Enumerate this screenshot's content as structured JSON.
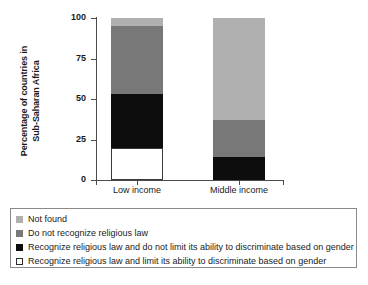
{
  "chart_data": {
    "type": "bar",
    "subtype": "stacked-bar",
    "title": "",
    "xlabel": "",
    "ylabel": "Percentage of countries in Sub-Saharan Africa",
    "ylabel_lines": [
      "Percentage of countries in",
      "Sub-Saharan Africa"
    ],
    "categories": [
      "Low income",
      "Middle income"
    ],
    "ylim": [
      0,
      100
    ],
    "yticks": [
      0,
      25,
      50,
      75,
      100
    ],
    "ytick_labels": [
      "0",
      "25",
      "50",
      "75",
      "100"
    ],
    "grid": false,
    "legend_position": "below",
    "series": [
      {
        "name": "Recognize religious law and limit its ability to discriminate based on gender",
        "color": "#ffffff",
        "border": "#3a3a3a",
        "values": [
          20,
          0
        ]
      },
      {
        "name": "Recognize religious law and do not limit its ability to discriminate based on gender",
        "color": "#0d0d0d",
        "values": [
          33,
          14
        ]
      },
      {
        "name": "Do not recognize religious law",
        "color": "#787878",
        "values": [
          42,
          23
        ]
      },
      {
        "name": "Not found",
        "color": "#b0b0b0",
        "values": [
          5,
          63
        ]
      }
    ]
  },
  "legend": {
    "items": [
      {
        "label": "Not found",
        "color": "#b0b0b0",
        "outlined": false
      },
      {
        "label": "Do not recognize religious law",
        "color": "#787878",
        "outlined": false
      },
      {
        "label": "Recognize religious law and do not limit its ability to discriminate based on gender",
        "color": "#0d0d0d",
        "outlined": false
      },
      {
        "label": "Recognize religious law and limit its ability to discriminate based on gender",
        "color": "#ffffff",
        "outlined": true
      }
    ]
  }
}
